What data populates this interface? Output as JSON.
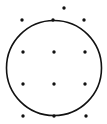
{
  "diagram": {
    "background": "#ffffff",
    "stroke_color": "#111111",
    "circle": {
      "cx": 54,
      "cy": 68,
      "r": 47.5,
      "stroke_width": 1.6
    },
    "dot_radius": 1.7,
    "dots": [
      {
        "x": 64,
        "y": 8
      },
      {
        "x": 22,
        "y": 20
      },
      {
        "x": 53,
        "y": 20
      },
      {
        "x": 84,
        "y": 20
      },
      {
        "x": 23,
        "y": 52
      },
      {
        "x": 54,
        "y": 52
      },
      {
        "x": 85,
        "y": 52
      },
      {
        "x": 23,
        "y": 84
      },
      {
        "x": 54,
        "y": 84
      },
      {
        "x": 85,
        "y": 84
      },
      {
        "x": 23,
        "y": 116
      },
      {
        "x": 54,
        "y": 116
      },
      {
        "x": 86,
        "y": 116
      }
    ]
  }
}
